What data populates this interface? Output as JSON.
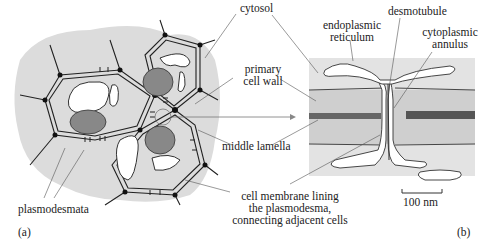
{
  "figure": {
    "panel_a_letter": "(a)",
    "panel_b_letter": "(b)",
    "labels": {
      "cytosol": "cytosol",
      "primary_cell_wall_1": "primary",
      "primary_cell_wall_2": "cell wall",
      "middle_lamella": "middle lamella",
      "membrane_1": "cell membrane lining",
      "membrane_2": "the plasmodesma,",
      "membrane_3": "connecting adjacent cells",
      "plasmodesmata": "plasmodesmata",
      "er_1": "endoplasmic",
      "er_2": "reticulum",
      "desmotubule": "desmotubule",
      "annulus_1": "cytoplasmic",
      "annulus_2": "annulus",
      "scale_bar": "100 nm"
    },
    "colors": {
      "cytosol_fill": "#dcdcdc",
      "wall_fill": "#d2d2d2",
      "line": "#333333",
      "text": "#222222"
    }
  }
}
